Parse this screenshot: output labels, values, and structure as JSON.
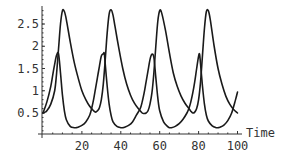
{
  "chart_data": {
    "type": "line",
    "title": "",
    "xlabel": "Time",
    "ylabel": "",
    "xlim": [
      0,
      100
    ],
    "ylim": [
      0.1,
      2.9
    ],
    "grid": false,
    "legend": null,
    "x_ticks": [
      20,
      40,
      60,
      80,
      100
    ],
    "x_tick_labels": [
      "20",
      "40",
      "60",
      "80",
      "100"
    ],
    "y_ticks": [
      0.5,
      1,
      1.5,
      2,
      2.5
    ],
    "y_tick_labels": [
      "0.5",
      "1",
      "1.5",
      "2",
      "2.5"
    ],
    "series": [
      {
        "name": "population-a (lower peaks)",
        "x": [
          0,
          2,
          4,
          5,
          6,
          7,
          8,
          9,
          10,
          11,
          12,
          14,
          16,
          17,
          18,
          20,
          22,
          24,
          25,
          26,
          27,
          28,
          29,
          30,
          31,
          31.5,
          32,
          33,
          34,
          35,
          36,
          38,
          40,
          41,
          42,
          44,
          46,
          48,
          50,
          51,
          52,
          53,
          54,
          55,
          56,
          57,
          58,
          59,
          60,
          62,
          64,
          65,
          66,
          68,
          70,
          72,
          74,
          75,
          76,
          77,
          78,
          79,
          80,
          80.5,
          81,
          82,
          83,
          84,
          85,
          87,
          89,
          90,
          91,
          93,
          95,
          97,
          99,
          100
        ],
        "y": [
          0.5,
          0.75,
          1.1,
          1.35,
          1.6,
          1.8,
          1.83,
          1.4,
          0.9,
          0.55,
          0.35,
          0.2,
          0.17,
          0.17,
          0.18,
          0.22,
          0.3,
          0.45,
          0.6,
          0.8,
          1.05,
          1.3,
          1.55,
          1.78,
          1.83,
          1.84,
          1.6,
          1.1,
          0.7,
          0.45,
          0.3,
          0.2,
          0.17,
          0.17,
          0.18,
          0.22,
          0.3,
          0.45,
          0.6,
          0.75,
          0.95,
          1.2,
          1.45,
          1.7,
          1.82,
          1.75,
          1.3,
          0.85,
          0.55,
          0.3,
          0.2,
          0.17,
          0.17,
          0.2,
          0.26,
          0.36,
          0.5,
          0.6,
          0.75,
          0.95,
          1.2,
          1.5,
          1.78,
          1.82,
          1.6,
          1.1,
          0.7,
          0.45,
          0.32,
          0.21,
          0.17,
          0.17,
          0.18,
          0.23,
          0.33,
          0.5,
          0.8,
          0.97
        ]
      },
      {
        "name": "population-b (higher peaks)",
        "x": [
          0,
          1,
          2,
          4,
          6,
          7,
          8,
          9,
          10,
          11,
          12,
          14,
          16,
          18,
          20,
          22,
          24,
          26,
          27,
          28,
          29,
          30,
          31,
          32,
          33,
          34,
          35,
          36,
          37,
          39,
          41,
          43,
          45,
          47,
          49,
          51,
          52,
          53,
          54,
          55,
          56,
          57,
          58,
          59,
          60,
          61,
          63,
          65,
          67,
          69,
          71,
          73,
          75,
          76,
          77,
          78,
          79,
          80,
          81,
          82,
          83,
          84,
          85,
          86,
          88,
          90,
          92,
          94,
          96,
          98,
          100
        ],
        "y": [
          0.5,
          0.52,
          0.55,
          0.7,
          1.0,
          1.4,
          1.95,
          2.5,
          2.8,
          2.78,
          2.6,
          2.1,
          1.65,
          1.3,
          1.0,
          0.8,
          0.65,
          0.55,
          0.52,
          0.55,
          0.62,
          0.8,
          1.15,
          1.7,
          2.3,
          2.72,
          2.82,
          2.7,
          2.45,
          1.95,
          1.5,
          1.15,
          0.9,
          0.72,
          0.6,
          0.5,
          0.49,
          0.5,
          0.55,
          0.7,
          0.95,
          1.4,
          2.0,
          2.55,
          2.8,
          2.75,
          2.35,
          1.85,
          1.4,
          1.1,
          0.88,
          0.72,
          0.6,
          0.54,
          0.5,
          0.52,
          0.6,
          0.8,
          1.2,
          1.8,
          2.4,
          2.78,
          2.8,
          2.6,
          2.0,
          1.5,
          1.15,
          0.88,
          0.7,
          0.58,
          0.5
        ]
      }
    ]
  },
  "axes": {
    "x_label": "Time"
  }
}
